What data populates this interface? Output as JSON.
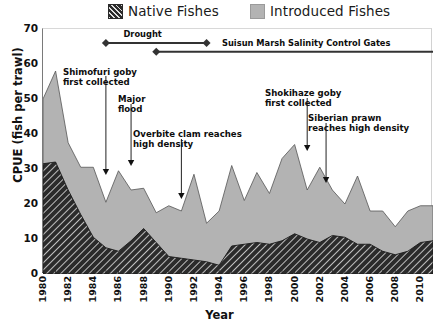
{
  "legend": {
    "items": [
      {
        "label": "Native Fishes",
        "key": "native",
        "color": "#2b2b2b",
        "pattern": "hatched"
      },
      {
        "label": "Introduced Fishes",
        "key": "introduced",
        "color": "#b3b3b3",
        "pattern": "solid"
      }
    ]
  },
  "axes": {
    "ylabel": "CPUE (fish per trawl)",
    "xlabel": "Year",
    "yticks": [
      0,
      10,
      20,
      30,
      40,
      50,
      60,
      70
    ],
    "xticks": [
      1980,
      1982,
      1984,
      1986,
      1988,
      1990,
      1992,
      1994,
      1996,
      1998,
      2000,
      2002,
      2004,
      2006,
      2008,
      2010
    ]
  },
  "event_bars": [
    {
      "name": "drought",
      "label": "Drought",
      "start": 1985.0,
      "end": 1993.0,
      "label_x": 1988.0,
      "y_value": 66.0,
      "marker": "diamond",
      "both_ends": true
    },
    {
      "name": "salinity-gates",
      "label": "Suisun Marsh Salinity Control Gates",
      "start": 1989.0,
      "end": 2011.5,
      "label_x": 2001.0,
      "y_value": 63.5,
      "marker": "diamond",
      "both_ends": false
    }
  ],
  "annotations": [
    {
      "name": "shimofuri-goby",
      "text": "Shimofuri goby\nfirst collected",
      "text_x": 63,
      "text_y": 67,
      "arrow_x": 1985.0,
      "arrow_top": 75,
      "arrow_bottom": 174
    },
    {
      "name": "major-flood",
      "text": "Major\nflood",
      "text_x": 118,
      "text_y": 94,
      "arrow_x": 1987.0,
      "arrow_top": 103,
      "arrow_bottom": 165
    },
    {
      "name": "overbite-clam",
      "text": "Overbite clam reaches\nhigh density",
      "text_x": 133,
      "text_y": 129,
      "arrow_x": 1991.0,
      "arrow_top": 138,
      "arrow_bottom": 198
    },
    {
      "name": "shokihaze-goby",
      "text": "Shokihaze goby\nfirst collected",
      "text_x": 265,
      "text_y": 88,
      "arrow_x": 2001.0,
      "arrow_top": 97,
      "arrow_bottom": 150
    },
    {
      "name": "siberian-prawn",
      "text": "Siberian prawn\nreaches high density",
      "text_x": 308,
      "text_y": 113,
      "arrow_x": 2002.5,
      "arrow_top": 122,
      "arrow_bottom": 182
    }
  ],
  "chart_data": {
    "type": "area",
    "stacked": true,
    "title": "",
    "xlabel": "Year",
    "ylabel": "CPUE (fish per trawl)",
    "xlim": [
      1980,
      2011
    ],
    "ylim": [
      0,
      70
    ],
    "grid": false,
    "legend_position": "top",
    "x": [
      1980,
      1981,
      1982,
      1983,
      1984,
      1985,
      1986,
      1987,
      1988,
      1989,
      1990,
      1991,
      1992,
      1993,
      1994,
      1995,
      1996,
      1997,
      1998,
      1999,
      2000,
      2001,
      2002,
      2003,
      2004,
      2005,
      2006,
      2007,
      2008,
      2009,
      2010,
      2011
    ],
    "series": [
      {
        "name": "Native Fishes",
        "color": "#2b2b2b",
        "values": [
          31.5,
          32.0,
          24.0,
          17.0,
          10.5,
          7.5,
          6.5,
          9.5,
          13.0,
          9.0,
          5.0,
          4.5,
          4.0,
          3.5,
          2.5,
          8.0,
          8.5,
          9.0,
          8.5,
          9.5,
          11.5,
          10.0,
          9.0,
          11.0,
          10.5,
          8.5,
          8.5,
          6.5,
          5.5,
          6.5,
          9.0,
          9.5
        ]
      },
      {
        "name": "Introduced Fishes",
        "color": "#b3b3b3",
        "values": [
          18.5,
          26.0,
          13.5,
          13.5,
          20.0,
          13.0,
          23.0,
          14.5,
          11.5,
          8.5,
          14.5,
          13.5,
          24.5,
          11.0,
          15.5,
          23.0,
          12.5,
          20.0,
          14.5,
          23.5,
          25.5,
          14.0,
          21.5,
          13.0,
          9.5,
          19.5,
          9.5,
          11.5,
          8.0,
          11.5,
          10.5,
          10.0
        ]
      }
    ],
    "totals": [
      50.0,
      58.0,
      37.5,
      30.5,
      30.5,
      20.5,
      29.5,
      24.0,
      24.5,
      17.5,
      19.5,
      18.0,
      28.5,
      14.5,
      18.0,
      31.0,
      21.0,
      29.0,
      23.0,
      33.0,
      37.0,
      24.0,
      30.5,
      24.0,
      20.0,
      28.0,
      18.0,
      18.0,
      13.5,
      18.0,
      19.5,
      19.5
    ]
  }
}
